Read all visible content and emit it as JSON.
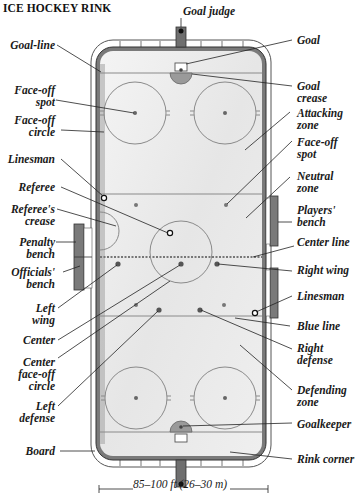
{
  "title": "ICE HOCKEY RINK",
  "colors": {
    "ice": "#ececec",
    "board": "#6f6f6f",
    "line": "#8a8a8a",
    "label_text": "#1a1a1a",
    "background": "#ffffff"
  },
  "labels_left": {
    "goal_line": "Goal-line",
    "faceoff_spot": "Face-off\nspot",
    "faceoff_circle": "Face-off\ncircle",
    "linesman": "Linesman",
    "referee": "Referee",
    "referees_crease": "Referee's\ncrease",
    "penalty_bench": "Penalty\nbench",
    "officials_bench": "Officials'\nbench",
    "left_wing": "Left\nwing",
    "center": "Center",
    "center_faceoff_circle": "Center\nface-off\ncircle",
    "left_defense": "Left\ndefense",
    "board": "Board"
  },
  "labels_right": {
    "goal_judge": "Goal judge",
    "goal": "Goal",
    "goal_crease": "Goal\ncrease",
    "attacking_zone": "Attacking\nzone",
    "faceoff_spot": "Face-off\nspot",
    "neutral_zone": "Neutral\nzone",
    "players_bench": "Players'\nbench",
    "center_line": "Center line",
    "right_wing": "Right wing",
    "linesman": "Linesman",
    "blue_line": "Blue line",
    "right_defense": "Right\ndefense",
    "defending_zone": "Defending\nzone",
    "goalkeeper": "Goalkeeper",
    "rink_corner": "Rink corner"
  },
  "scale": {
    "text": "85–100 ft (26–30 m)"
  }
}
